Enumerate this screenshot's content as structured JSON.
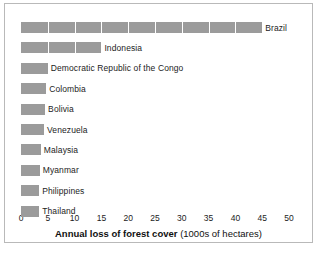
{
  "chart_data": {
    "type": "bar",
    "orientation": "horizontal",
    "title": "",
    "xlabel_bold": "Annual loss of forest cover",
    "xlabel_light": "(1000s of hectares)",
    "ylabel": "",
    "xlim": [
      0,
      50
    ],
    "xticks": [
      0,
      5,
      10,
      15,
      20,
      25,
      30,
      35,
      40,
      45,
      50
    ],
    "xtick_labels": [
      "0",
      "5",
      "10",
      "15",
      "20",
      "25",
      "30",
      "35",
      "40",
      "45",
      "50"
    ],
    "grid": "vertical white gridlines every 5 units over bars",
    "legend": "none",
    "bar_color": "#9b9b9b",
    "categories": [
      "Brazil",
      "Indonesia",
      "Democratic Republic of the Congo",
      "Colombia",
      "Bolivia",
      "Venezuela",
      "Malaysia",
      "Myanmar",
      "Philippines",
      "Thailand"
    ],
    "values": [
      45,
      15,
      5,
      4.7,
      4.5,
      4.3,
      3.7,
      3.5,
      3.4,
      3.4
    ]
  },
  "figure": {
    "frame_color": "#b9b9b9",
    "background": "#ffffff",
    "text_color": "#1c1c1c"
  }
}
